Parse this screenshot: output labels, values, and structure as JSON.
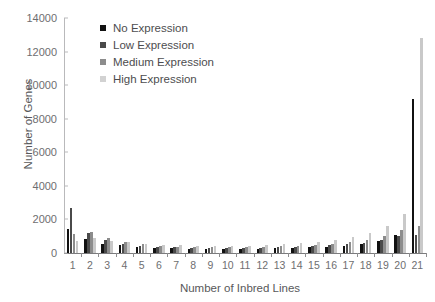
{
  "chart_data": {
    "type": "bar",
    "title": "",
    "xlabel": "Number of Inbred Lines",
    "ylabel": "Number of Genes",
    "categories": [
      "1",
      "2",
      "3",
      "4",
      "5",
      "6",
      "7",
      "8",
      "9",
      "10",
      "11",
      "12",
      "13",
      "14",
      "15",
      "16",
      "17",
      "18",
      "19",
      "20",
      "21"
    ],
    "ylim": [
      0,
      14000
    ],
    "yticks": [
      "0",
      "2000",
      "4000",
      "6000",
      "8000",
      "10000",
      "12000",
      "14000"
    ],
    "grid": false,
    "legend_position": "top-left-inside",
    "series": [
      {
        "name": "No Expression",
        "color": "#111111",
        "values": [
          1450,
          830,
          560,
          450,
          330,
          300,
          270,
          260,
          250,
          250,
          250,
          260,
          270,
          300,
          330,
          380,
          430,
          520,
          700,
          1050,
          9200
        ]
      },
      {
        "name": "Low Expression",
        "color": "#4a4a4a",
        "values": [
          2700,
          1200,
          770,
          560,
          430,
          370,
          330,
          300,
          290,
          290,
          300,
          310,
          330,
          360,
          400,
          450,
          520,
          620,
          780,
          1000,
          1050
        ]
      },
      {
        "name": "Medium Expression",
        "color": "#8c8c8c",
        "values": [
          1150,
          1280,
          900,
          640,
          520,
          430,
          380,
          350,
          330,
          330,
          340,
          360,
          390,
          430,
          490,
          560,
          650,
          790,
          1000,
          1350,
          1600
        ]
      },
      {
        "name": "High Expression",
        "color": "#c9c9c9",
        "values": [
          720,
          880,
          740,
          640,
          560,
          500,
          460,
          430,
          420,
          420,
          440,
          470,
          520,
          590,
          680,
          800,
          960,
          1200,
          1600,
          2350,
          12800
        ]
      }
    ]
  },
  "legend": {
    "items": [
      {
        "label": "No Expression",
        "color": "#111111"
      },
      {
        "label": "Low Expression",
        "color": "#4a4a4a"
      },
      {
        "label": "Medium Expression",
        "color": "#8c8c8c"
      },
      {
        "label": "High Expression",
        "color": "#d2d2d2"
      }
    ]
  }
}
